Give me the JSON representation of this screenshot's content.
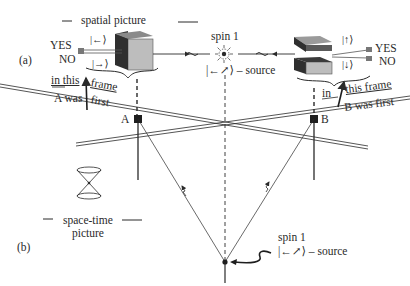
{
  "panel_a": {
    "label": "(a)",
    "title": "spatial picture",
    "left_detector": {
      "yes": "YES",
      "no": "NO",
      "state_up": "|←⟩",
      "state_down": "|→⟩"
    },
    "right_detector": {
      "yes": "YES",
      "no": "NO",
      "state_up": "|↑⟩",
      "state_down": "|↓⟩"
    },
    "source": {
      "spin": "spin 1",
      "state": "|←↗⟩ – source"
    },
    "frame_a": {
      "line1_left": "in this",
      "line1_right": "frame",
      "line2_left": "A was",
      "line2_right": "first"
    },
    "frame_b": {
      "line1_left": "in",
      "line1_right": "this frame",
      "line2": "B was first"
    }
  },
  "panel_b": {
    "label": "(b)",
    "title_line1": "space-time",
    "title_line2": "picture",
    "event_a": "A",
    "event_b": "B",
    "source": {
      "spin": "spin 1",
      "state": "|←↗⟩ – source"
    }
  },
  "colors": {
    "ink": "#2a2a2a",
    "box_dark": "#3a3a3a",
    "box_light": "#bdbdbd",
    "box_mid": "#8a8a8a"
  }
}
